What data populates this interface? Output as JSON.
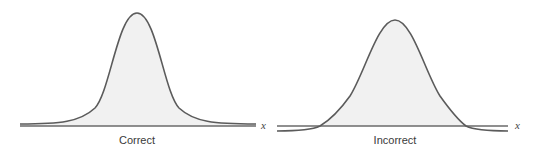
{
  "figure": {
    "panels": [
      {
        "id": "correct",
        "label": "Correct",
        "axis_variable": "x",
        "description": "Normal curve whose tails approach but stay above the x-axis"
      },
      {
        "id": "incorrect",
        "label": "Incorrect",
        "axis_variable": "x",
        "description": "Bell curve whose tails cross below the x-axis"
      }
    ],
    "colors": {
      "curve": "#5b5b5b",
      "fill": "#f1f1f1",
      "axis": "#6a6a6a",
      "background": "#ffffff"
    }
  }
}
